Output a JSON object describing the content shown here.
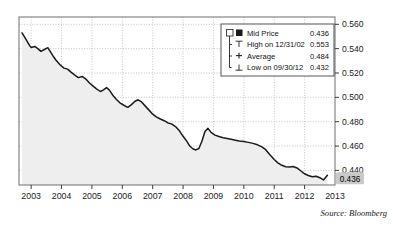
{
  "chart_data": {
    "type": "line",
    "title": "",
    "subtitle": "",
    "xlabel": "",
    "ylabel": "",
    "xlim": [
      2002.6,
      2013.0
    ],
    "ylim": [
      0.428,
      0.566
    ],
    "grid": true,
    "legend_position": "top-right",
    "x_ticks": [
      "2003",
      "2004",
      "2005",
      "2006",
      "2007",
      "2008",
      "2009",
      "2010",
      "2011",
      "2012",
      "2013"
    ],
    "y_ticks": [
      "0.560",
      "0.540",
      "0.520",
      "0.500",
      "0.480",
      "0.460",
      "0.440"
    ],
    "y_tick_values": [
      0.56,
      0.54,
      0.52,
      0.5,
      0.48,
      0.46,
      0.44
    ],
    "series": [
      {
        "name": "Mid Price",
        "color": "#1a1a1a",
        "fill_color": "#eeeeee",
        "x": [
          2002.7,
          2002.82,
          2002.95,
          2003.0,
          2003.12,
          2003.22,
          2003.32,
          2003.45,
          2003.55,
          2003.62,
          2003.72,
          2003.82,
          2003.95,
          2004.08,
          2004.2,
          2004.32,
          2004.45,
          2004.55,
          2004.68,
          2004.8,
          2004.92,
          2005.05,
          2005.15,
          2005.28,
          2005.38,
          2005.48,
          2005.58,
          2005.68,
          2005.8,
          2005.92,
          2006.05,
          2006.18,
          2006.3,
          2006.42,
          2006.52,
          2006.62,
          2006.75,
          2006.88,
          2007.0,
          2007.12,
          2007.25,
          2007.38,
          2007.5,
          2007.62,
          2007.75,
          2007.88,
          2008.0,
          2008.12,
          2008.22,
          2008.32,
          2008.42,
          2008.52,
          2008.62,
          2008.72,
          2008.82,
          2008.92,
          2009.05,
          2009.18,
          2009.32,
          2009.45,
          2009.58,
          2009.72,
          2009.85,
          2010.0,
          2010.15,
          2010.3,
          2010.45,
          2010.58,
          2010.72,
          2010.85,
          2011.0,
          2011.12,
          2011.25,
          2011.38,
          2011.5,
          2011.62,
          2011.75,
          2011.88,
          2012.0,
          2012.12,
          2012.25,
          2012.38,
          2012.5,
          2012.62,
          2012.75
        ],
        "y": [
          0.553,
          0.548,
          0.5425,
          0.541,
          0.5418,
          0.54,
          0.5378,
          0.5395,
          0.5408,
          0.538,
          0.534,
          0.5305,
          0.5268,
          0.524,
          0.5232,
          0.5205,
          0.518,
          0.5162,
          0.5172,
          0.515,
          0.5118,
          0.509,
          0.507,
          0.5048,
          0.5062,
          0.508,
          0.5058,
          0.502,
          0.4985,
          0.4955,
          0.4935,
          0.4918,
          0.494,
          0.4968,
          0.498,
          0.4965,
          0.493,
          0.4895,
          0.4862,
          0.484,
          0.4822,
          0.4808,
          0.479,
          0.4782,
          0.476,
          0.4725,
          0.468,
          0.464,
          0.46,
          0.4578,
          0.4568,
          0.458,
          0.464,
          0.472,
          0.4745,
          0.4712,
          0.469,
          0.4678,
          0.4668,
          0.4662,
          0.4655,
          0.4648,
          0.4642,
          0.4638,
          0.463,
          0.4622,
          0.461,
          0.4595,
          0.457,
          0.453,
          0.449,
          0.4462,
          0.4442,
          0.443,
          0.4428,
          0.4432,
          0.442,
          0.4395,
          0.4372,
          0.4358,
          0.4348,
          0.4352,
          0.434,
          0.4322,
          0.436
        ]
      }
    ],
    "annotations": {
      "last_value_badge": "0.436",
      "average_line": 0.484,
      "high_value": 0.553,
      "low_value": 0.432
    }
  },
  "legend": {
    "rows": [
      {
        "marker": "checkbox-filled-square",
        "label": "Mid Price",
        "value": "0.436"
      },
      {
        "marker": "high-tee",
        "label": "High on 12/31/02",
        "value": "0.553"
      },
      {
        "marker": "average-plus",
        "label": "Average",
        "value": "0.484"
      },
      {
        "marker": "low-tee",
        "label": "Low on 09/30/12",
        "value": "0.432"
      }
    ]
  },
  "footer": {
    "source": "Source: Bloomberg"
  },
  "colors": {
    "line": "#1a1a1a",
    "area_fill": "#ededed",
    "grid": "#b8b8b8",
    "frame": "#6e6e6e",
    "badge_bg": "#c9c9c9",
    "legend_border": "#555555",
    "background": "#ffffff"
  }
}
